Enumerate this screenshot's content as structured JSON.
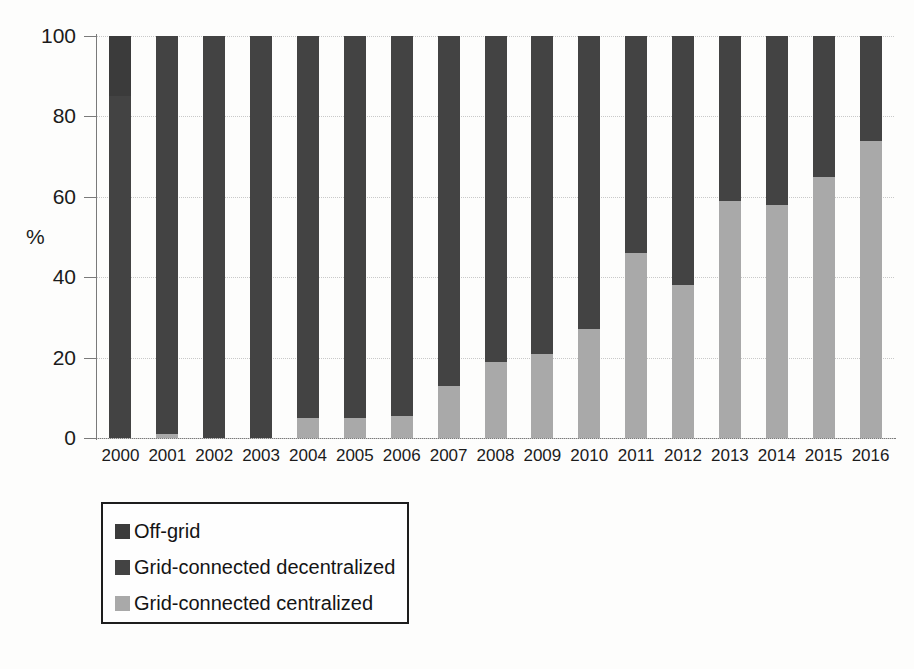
{
  "chart_data": {
    "type": "bar",
    "stacked": true,
    "title": "",
    "subtitle": "",
    "xlabel": "",
    "ylabel": "%",
    "ylim": [
      0,
      100
    ],
    "yticks": [
      "0",
      "20",
      "40",
      "60",
      "80",
      "100"
    ],
    "grid": true,
    "legend_position": "below-left",
    "categories": [
      "2000",
      "2001",
      "2002",
      "2003",
      "2004",
      "2005",
      "2006",
      "2007",
      "2008",
      "2009",
      "2010",
      "2011",
      "2012",
      "2013",
      "2014",
      "2015",
      "2016"
    ],
    "series": [
      {
        "name": "Grid-connected centralized",
        "color": "#a9a9a9",
        "values": [
          0,
          1,
          0,
          0,
          5,
          5,
          5.5,
          13,
          19,
          21,
          27,
          46,
          38,
          59,
          58,
          65,
          74
        ]
      },
      {
        "name": "Grid-connected decentralized",
        "color": "#434343",
        "values": [
          85,
          99,
          100,
          100,
          95,
          95,
          94.5,
          87,
          81,
          79,
          73,
          54,
          62,
          41,
          42,
          35,
          26
        ]
      },
      {
        "name": "Off-grid",
        "color": "#3b3b3b",
        "values": [
          15,
          0,
          0,
          0,
          0,
          0,
          0,
          0,
          0,
          0,
          0,
          0,
          0,
          0,
          0,
          0,
          0
        ]
      }
    ]
  },
  "legend": {
    "items": [
      {
        "label": "Off-grid",
        "color": "#3b3b3b"
      },
      {
        "label": "Grid-connected decentralized",
        "color": "#434343"
      },
      {
        "label": "Grid-connected centralized",
        "color": "#a9a9a9"
      }
    ]
  }
}
